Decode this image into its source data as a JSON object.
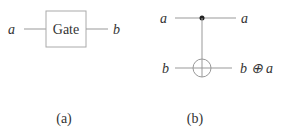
{
  "panel_a": {
    "input_label": "a",
    "gate_label": "Gate",
    "output_label": "b",
    "caption": "(a)"
  },
  "panel_b": {
    "control_in_label": "a",
    "control_out_label": "a",
    "target_in_label": "b",
    "target_out_label": "b ⊕ a",
    "caption": "(b)"
  }
}
